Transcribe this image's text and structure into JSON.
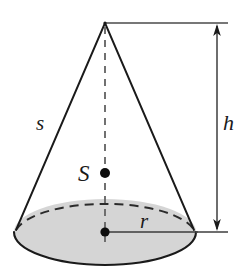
{
  "figure": {
    "kind": "cone-geometry-diagram",
    "background_color": "#ffffff",
    "stroke_color": "#1a1a1a",
    "dash_color": "#555555",
    "base_fill_color": "#d5d5d5",
    "base_stroke_color": "#1a1a1a"
  },
  "labels": {
    "slant": "s",
    "center_point": "S",
    "height": "h",
    "radius": "r"
  },
  "geometry": {
    "apex": {
      "x": 105,
      "y": 23
    },
    "base_center": {
      "x": 105,
      "y": 232
    },
    "base_rx": 91,
    "base_ry": 33,
    "center_point_marker": {
      "x": 105,
      "y": 173,
      "radius": 5
    },
    "base_center_marker": {
      "x": 105,
      "y": 232,
      "radius": 4.5
    },
    "left_base_contact": {
      "x": 16,
      "y": 229
    },
    "right_base_contact": {
      "x": 194,
      "y": 229
    },
    "height_dimension_line_x": 217,
    "height_dimension_top_y": 23,
    "height_dimension_bottom_y": 232,
    "top_extension_line": {
      "x1": 105,
      "y1": 23,
      "x2": 226,
      "y2": 23
    },
    "bottom_extension_line": {
      "x1": 105,
      "y1": 232,
      "x2": 226,
      "y2": 232
    },
    "radius_line": {
      "x1": 105,
      "y1": 232,
      "x2": 197,
      "y2": 232
    }
  },
  "label_positions": {
    "slant": {
      "x": 36,
      "y": 130
    },
    "center_point": {
      "x": 78,
      "y": 181
    },
    "height": {
      "x": 222,
      "y": 130
    },
    "radius": {
      "x": 140,
      "y": 228
    }
  }
}
